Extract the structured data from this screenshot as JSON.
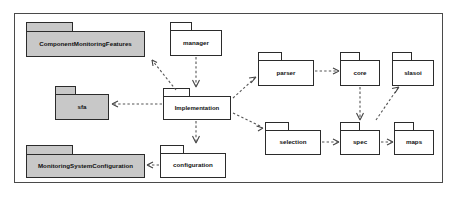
{
  "diagram": {
    "type": "uml-package-diagram",
    "frame": {
      "x": 14,
      "y": 13,
      "width": 429,
      "height": 170
    },
    "colors": {
      "shaded_fill": "#c8c8c8",
      "plain_fill": "#ffffff",
      "border": "#2b2b2b",
      "frame_border": "#4a4a4a",
      "link": "#555555",
      "background": "#ffffff"
    },
    "packages": [
      {
        "id": "component-monitoring-features",
        "label": "ComponentMonitoringFeatures",
        "style": "shaded",
        "tab": {
          "x": 26,
          "y": 22,
          "width": 47,
          "height": 9
        },
        "body": {
          "x": 26,
          "y": 31,
          "width": 119,
          "height": 26
        }
      },
      {
        "id": "manager",
        "label": "manager",
        "style": "plain",
        "tab": {
          "x": 170,
          "y": 22,
          "width": 22,
          "height": 8
        },
        "body": {
          "x": 170,
          "y": 30,
          "width": 52,
          "height": 26
        }
      },
      {
        "id": "parser",
        "label": "parser",
        "style": "plain",
        "tab": {
          "x": 258,
          "y": 52,
          "width": 24,
          "height": 8
        },
        "body": {
          "x": 258,
          "y": 60,
          "width": 56,
          "height": 26
        }
      },
      {
        "id": "core",
        "label": "core",
        "style": "plain",
        "tab": {
          "x": 340,
          "y": 52,
          "width": 20,
          "height": 8
        },
        "body": {
          "x": 340,
          "y": 60,
          "width": 40,
          "height": 26
        }
      },
      {
        "id": "slasoi",
        "label": "slasoi",
        "style": "plain",
        "tab": {
          "x": 392,
          "y": 52,
          "width": 20,
          "height": 8
        },
        "body": {
          "x": 392,
          "y": 60,
          "width": 42,
          "height": 26
        }
      },
      {
        "id": "sfa",
        "label": "sfa",
        "style": "shaded",
        "tab": {
          "x": 55,
          "y": 86,
          "width": 21,
          "height": 8
        },
        "body": {
          "x": 55,
          "y": 94,
          "width": 54,
          "height": 26
        }
      },
      {
        "id": "implementation",
        "label": "Implementation",
        "style": "plain",
        "tab": {
          "x": 163,
          "y": 88,
          "width": 27,
          "height": 8
        },
        "body": {
          "x": 163,
          "y": 96,
          "width": 68,
          "height": 24
        }
      },
      {
        "id": "selection",
        "label": "selection",
        "style": "plain",
        "tab": {
          "x": 265,
          "y": 122,
          "width": 24,
          "height": 8
        },
        "body": {
          "x": 265,
          "y": 130,
          "width": 56,
          "height": 25
        }
      },
      {
        "id": "spec",
        "label": "spec",
        "style": "plain",
        "tab": {
          "x": 340,
          "y": 122,
          "width": 20,
          "height": 8
        },
        "body": {
          "x": 340,
          "y": 130,
          "width": 40,
          "height": 25
        }
      },
      {
        "id": "maps",
        "label": "maps",
        "style": "plain",
        "tab": {
          "x": 394,
          "y": 122,
          "width": 20,
          "height": 8
        },
        "body": {
          "x": 394,
          "y": 130,
          "width": 40,
          "height": 25
        }
      },
      {
        "id": "monitoring-system-configuration",
        "label": "MonitoringSystemConfiguration",
        "style": "shaded",
        "tab": {
          "x": 26,
          "y": 145,
          "width": 47,
          "height": 9
        },
        "body": {
          "x": 26,
          "y": 154,
          "width": 119,
          "height": 24
        }
      },
      {
        "id": "configuration",
        "label": "configuration",
        "style": "plain",
        "tab": {
          "x": 160,
          "y": 145,
          "width": 24,
          "height": 8
        },
        "body": {
          "x": 160,
          "y": 153,
          "width": 66,
          "height": 25
        }
      }
    ],
    "dependencies": [
      {
        "from": "implementation",
        "to": "component-monitoring-features",
        "kind": "dashed-open-arrow"
      },
      {
        "from": "implementation",
        "to": "sfa",
        "kind": "dashed-open-arrow"
      },
      {
        "from": "manager",
        "to": "implementation",
        "kind": "dashed-open-arrow"
      },
      {
        "from": "implementation",
        "to": "parser",
        "kind": "dashed-open-arrow"
      },
      {
        "from": "parser",
        "to": "core",
        "kind": "dashed-open-arrow"
      },
      {
        "from": "core",
        "to": "spec",
        "kind": "dashed-open-arrow"
      },
      {
        "from": "spec",
        "to": "slasoi",
        "kind": "dashed-open-arrow"
      },
      {
        "from": "implementation",
        "to": "selection",
        "kind": "dashed-open-arrow"
      },
      {
        "from": "selection",
        "to": "spec",
        "kind": "dashed-open-arrow"
      },
      {
        "from": "spec",
        "to": "maps",
        "kind": "dashed-open-arrow"
      },
      {
        "from": "implementation",
        "to": "configuration",
        "kind": "dashed-open-arrow"
      },
      {
        "from": "configuration",
        "to": "monitoring-system-configuration",
        "kind": "dashed-open-arrow"
      }
    ]
  }
}
